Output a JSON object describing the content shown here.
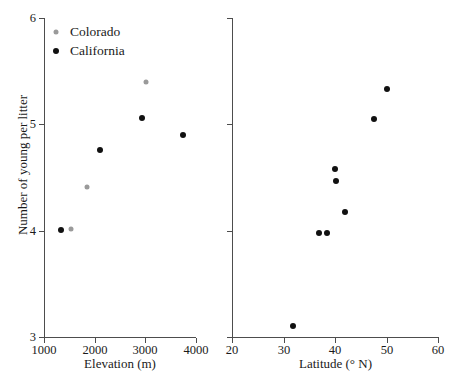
{
  "figure": {
    "width": 457,
    "height": 378,
    "background": "#ffffff",
    "series_colors": {
      "California": "#111111",
      "Colorado": "#9a9a9a"
    },
    "axis_color": "#4d4d4d",
    "text_color": "#1a1a1a"
  },
  "legend": {
    "position": "top-left of left panel",
    "entries": [
      {
        "label": "Colorado",
        "marker": "gray-filled-circle",
        "color": "#9a9a9a"
      },
      {
        "label": "California",
        "marker": "black-filled-circle",
        "color": "#111111"
      }
    ]
  },
  "chart_data": [
    {
      "id": "panel-elevation",
      "type": "scatter",
      "title": "",
      "xlabel": "Elevation (m)",
      "ylabel": "Number of young per litter",
      "xlim": [
        1000,
        4000
      ],
      "ylim": [
        3,
        6
      ],
      "xticks": [
        1000,
        2000,
        3000,
        4000
      ],
      "yticks": [
        3,
        4,
        5,
        6
      ],
      "xticklabels": [
        "1000",
        "2000",
        "3000",
        "4000"
      ],
      "yticklabels": [
        "3",
        "4",
        "5",
        "6"
      ],
      "grid": false,
      "legend": "upper-left",
      "series": [
        {
          "name": "California",
          "color": "#111111",
          "points": [
            {
              "x": 1330,
              "y": 4.01
            },
            {
              "x": 2110,
              "y": 4.76
            },
            {
              "x": 2930,
              "y": 5.06
            },
            {
              "x": 3750,
              "y": 4.9
            }
          ]
        },
        {
          "name": "Colorado",
          "color": "#9a9a9a",
          "points": [
            {
              "x": 1530,
              "y": 4.02
            },
            {
              "x": 1840,
              "y": 4.41
            },
            {
              "x": 3010,
              "y": 5.4
            }
          ]
        }
      ]
    },
    {
      "id": "panel-latitude",
      "type": "scatter",
      "title": "",
      "xlabel": "Latitude (° N)",
      "ylabel": "",
      "xlim": [
        20,
        60
      ],
      "ylim": [
        3,
        6
      ],
      "xticks": [
        20,
        30,
        40,
        50,
        60
      ],
      "yticks": [
        3,
        4,
        5,
        6
      ],
      "xticklabels": [
        "20",
        "30",
        "40",
        "50",
        "60"
      ],
      "yticklabels": [
        "",
        "",
        "",
        ""
      ],
      "grid": false,
      "legend": "none",
      "series": [
        {
          "name": "California",
          "color": "#111111",
          "points": [
            {
              "x": 31.8,
              "y": 3.1
            },
            {
              "x": 36.9,
              "y": 3.98
            },
            {
              "x": 38.4,
              "y": 3.98
            },
            {
              "x": 41.9,
              "y": 4.18
            },
            {
              "x": 40.2,
              "y": 4.47
            },
            {
              "x": 40.0,
              "y": 4.58
            },
            {
              "x": 47.6,
              "y": 5.05
            },
            {
              "x": 50.1,
              "y": 5.33
            }
          ]
        }
      ]
    }
  ]
}
